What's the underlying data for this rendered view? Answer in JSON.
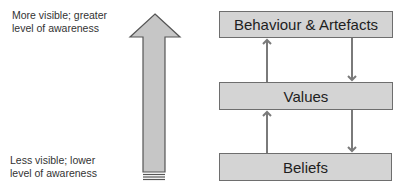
{
  "diagram": {
    "left_labels": {
      "top": [
        "More visible; greater",
        "level of awareness"
      ],
      "bottom": [
        "Less visible; lower",
        "level of awareness"
      ]
    },
    "big_arrow": {
      "direction": "up",
      "icon": "arrow-up-icon",
      "fill": "#c6c6c6",
      "stroke": "#555555"
    },
    "boxes": [
      {
        "label": "Behaviour & Artefacts"
      },
      {
        "label": "Values"
      },
      {
        "label": "Beliefs"
      }
    ],
    "connectors": [
      {
        "from": "Values",
        "to": "Behaviour & Artefacts",
        "direction": "up"
      },
      {
        "from": "Behaviour & Artefacts",
        "to": "Values",
        "direction": "down"
      },
      {
        "from": "Beliefs",
        "to": "Values",
        "direction": "up"
      },
      {
        "from": "Values",
        "to": "Beliefs",
        "direction": "down"
      }
    ],
    "colors": {
      "box_fill": "#d4d4d4",
      "box_border": "#6e6e6e",
      "connector": "#7a7a7a"
    }
  }
}
